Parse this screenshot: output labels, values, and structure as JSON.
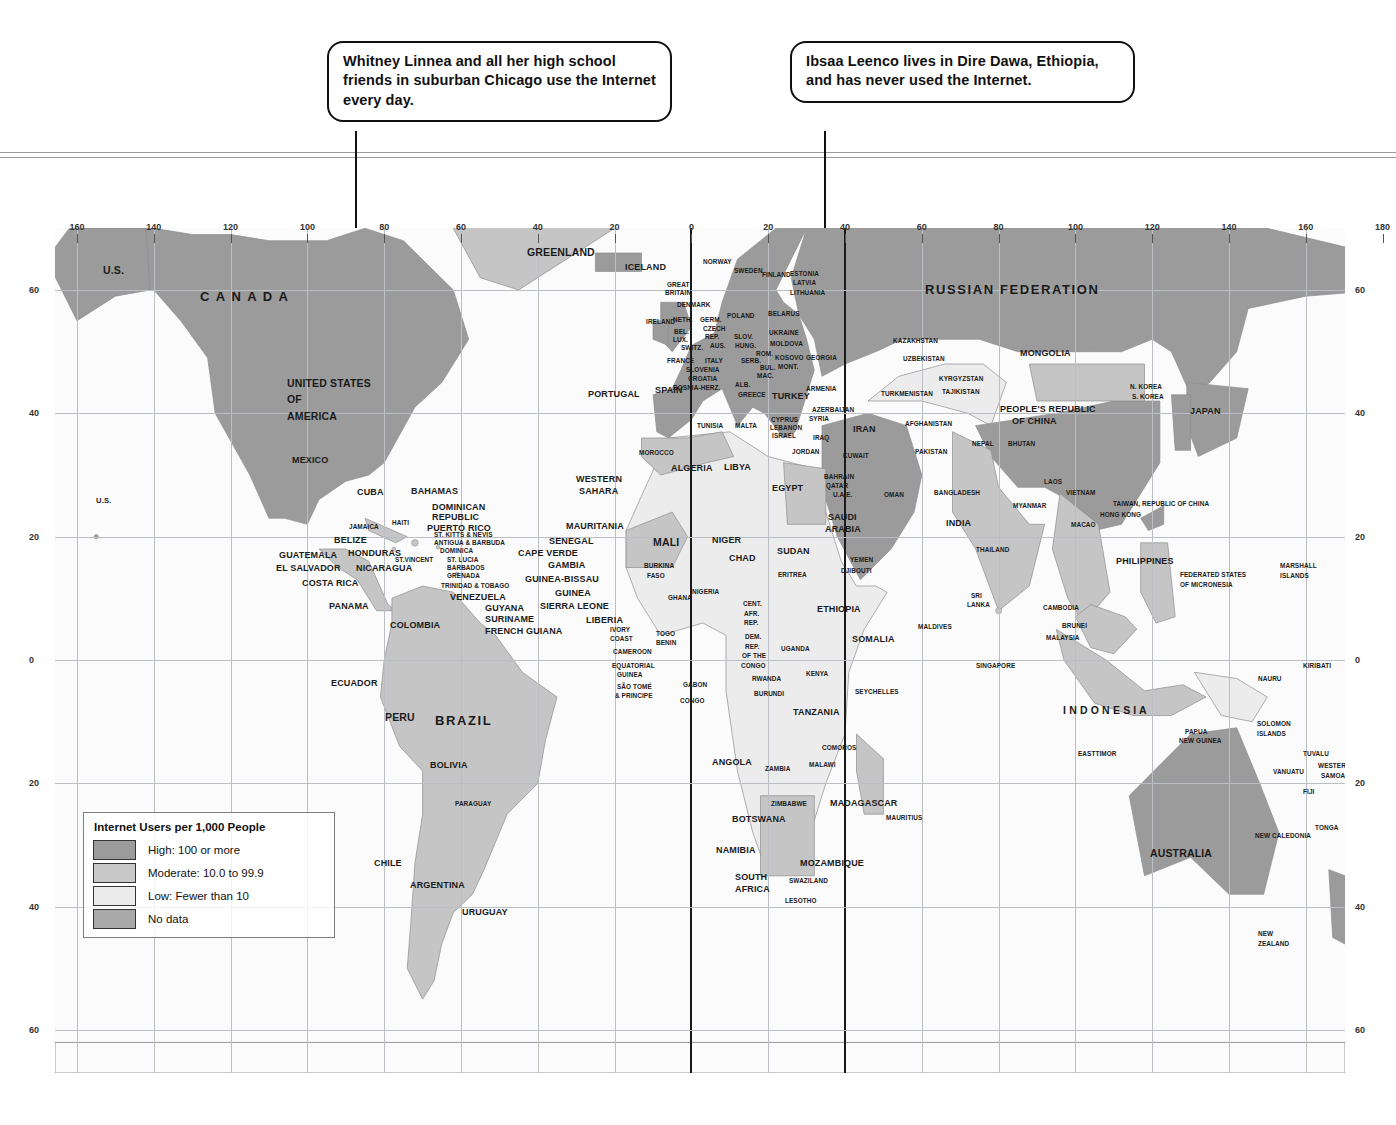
{
  "callouts": [
    {
      "id": "chicago",
      "text": "Whitney Linnea and all her high school friends in suburban Chicago use the Internet every day."
    },
    {
      "id": "ethiopia",
      "text": "Ibsaa Leenco lives in Dire Dawa, Ethiopia, and has never used the Internet."
    }
  ],
  "legend": {
    "title": "Internet Users per 1,000 People",
    "items": [
      {
        "label": "High: 100 or more",
        "color": "#9b9b9b"
      },
      {
        "label": "Moderate: 10.0 to 99.9",
        "color": "#c2c2c2"
      },
      {
        "label": "Low: Fewer than 10",
        "color": "#e8e8e8"
      },
      {
        "label": "No data",
        "color": "#a8a8a8"
      }
    ]
  },
  "axes": {
    "longitude_labels": [
      "160",
      "140",
      "120",
      "100",
      "80",
      "60",
      "40",
      "20",
      "0",
      "20",
      "40",
      "60",
      "80",
      "100",
      "120",
      "140",
      "160",
      "180"
    ],
    "latitude_labels_left": [
      "60",
      "40",
      "20",
      "0",
      "20",
      "40",
      "60"
    ],
    "latitude_labels_right": [
      "60",
      "40",
      "20",
      "0",
      "20",
      "40",
      "60"
    ]
  },
  "map_labels": [
    {
      "t": "U.S.",
      "x": 103,
      "y": 265,
      "s": "m"
    },
    {
      "t": "U.S.",
      "x": 96,
      "y": 497,
      "s": "s"
    },
    {
      "t": "C A N A D A",
      "x": 200,
      "y": 290,
      "s": "l"
    },
    {
      "t": "GREENLAND",
      "x": 527,
      "y": 247,
      "s": "m"
    },
    {
      "t": "UNITED STATES",
      "x": 287,
      "y": 378,
      "s": "m"
    },
    {
      "t": "OF",
      "x": 287,
      "y": 394,
      "s": "m"
    },
    {
      "t": "AMERICA",
      "x": 287,
      "y": 411,
      "s": "m"
    },
    {
      "t": "ICELAND",
      "x": 625,
      "y": 262,
      "s": ""
    },
    {
      "t": "MEXICO",
      "x": 292,
      "y": 455,
      "s": ""
    },
    {
      "t": "CUBA",
      "x": 357,
      "y": 487,
      "s": ""
    },
    {
      "t": "BAHAMAS",
      "x": 411,
      "y": 486,
      "s": ""
    },
    {
      "t": "DOMINICAN",
      "x": 432,
      "y": 502,
      "s": ""
    },
    {
      "t": "REPUBLIC",
      "x": 432,
      "y": 512,
      "s": ""
    },
    {
      "t": "PUERTO RICO",
      "x": 427,
      "y": 523,
      "s": ""
    },
    {
      "t": "HAITI",
      "x": 392,
      "y": 519,
      "s": "xs"
    },
    {
      "t": "JAMAICA",
      "x": 349,
      "y": 523,
      "s": "xs"
    },
    {
      "t": "ST. KITTS & NEVIS",
      "x": 434,
      "y": 531,
      "s": "xs"
    },
    {
      "t": "ANTIGUA & BARBUDA",
      "x": 434,
      "y": 539,
      "s": "xs"
    },
    {
      "t": "DOMINICA",
      "x": 440,
      "y": 547,
      "s": "xs"
    },
    {
      "t": "ST. LUCIA",
      "x": 447,
      "y": 556,
      "s": "xs"
    },
    {
      "t": "BARBADOS",
      "x": 447,
      "y": 564,
      "s": "xs"
    },
    {
      "t": "GRENADA",
      "x": 447,
      "y": 572,
      "s": "xs"
    },
    {
      "t": "ST.VINCENT",
      "x": 395,
      "y": 556,
      "s": "xs"
    },
    {
      "t": "TRINIDAD & TOBAGO",
      "x": 441,
      "y": 582,
      "s": "xs"
    },
    {
      "t": "BELIZE",
      "x": 334,
      "y": 535,
      "s": ""
    },
    {
      "t": "HONDURAS",
      "x": 348,
      "y": 548,
      "s": ""
    },
    {
      "t": "GUATEMALA",
      "x": 279,
      "y": 550,
      "s": ""
    },
    {
      "t": "EL SALVADOR",
      "x": 276,
      "y": 563,
      "s": ""
    },
    {
      "t": "NICARAGUA",
      "x": 356,
      "y": 563,
      "s": ""
    },
    {
      "t": "COSTA RICA",
      "x": 302,
      "y": 578,
      "s": ""
    },
    {
      "t": "PANAMA",
      "x": 329,
      "y": 601,
      "s": ""
    },
    {
      "t": "VENEZUELA",
      "x": 450,
      "y": 592,
      "s": ""
    },
    {
      "t": "GUYANA",
      "x": 485,
      "y": 603,
      "s": ""
    },
    {
      "t": "SURINAME",
      "x": 485,
      "y": 614,
      "s": ""
    },
    {
      "t": "FRENCH GUIANA",
      "x": 485,
      "y": 626,
      "s": ""
    },
    {
      "t": "COLOMBIA",
      "x": 390,
      "y": 620,
      "s": ""
    },
    {
      "t": "ECUADOR",
      "x": 331,
      "y": 678,
      "s": ""
    },
    {
      "t": "PERU",
      "x": 385,
      "y": 712,
      "s": "m"
    },
    {
      "t": "BRAZIL",
      "x": 435,
      "y": 714,
      "s": "l"
    },
    {
      "t": "BOLIVIA",
      "x": 430,
      "y": 760,
      "s": ""
    },
    {
      "t": "PARAGUAY",
      "x": 455,
      "y": 800,
      "s": "xs"
    },
    {
      "t": "CHILE",
      "x": 374,
      "y": 858,
      "s": ""
    },
    {
      "t": "ARGENTINA",
      "x": 410,
      "y": 880,
      "s": ""
    },
    {
      "t": "URUGUAY",
      "x": 462,
      "y": 907,
      "s": ""
    },
    {
      "t": "NORWAY",
      "x": 703,
      "y": 258,
      "s": "xs"
    },
    {
      "t": "SWEDEN",
      "x": 734,
      "y": 267,
      "s": "xs"
    },
    {
      "t": "FINLAND",
      "x": 762,
      "y": 271,
      "s": "xs"
    },
    {
      "t": "ESTONIA",
      "x": 790,
      "y": 270,
      "s": "xs"
    },
    {
      "t": "LATVIA",
      "x": 793,
      "y": 279,
      "s": "xs"
    },
    {
      "t": "LITHUANIA",
      "x": 790,
      "y": 289,
      "s": "xs"
    },
    {
      "t": "GREAT",
      "x": 667,
      "y": 281,
      "s": "xs"
    },
    {
      "t": "BRITAIN",
      "x": 665,
      "y": 289,
      "s": "xs"
    },
    {
      "t": "DENMARK",
      "x": 677,
      "y": 301,
      "s": "xs"
    },
    {
      "t": "IRELAND",
      "x": 646,
      "y": 318,
      "s": "xs"
    },
    {
      "t": "POLAND",
      "x": 727,
      "y": 312,
      "s": "xs"
    },
    {
      "t": "BELARUS",
      "x": 768,
      "y": 310,
      "s": "xs"
    },
    {
      "t": "NETH.",
      "x": 673,
      "y": 316,
      "s": "xs"
    },
    {
      "t": "GERM.",
      "x": 700,
      "y": 316,
      "s": "xs"
    },
    {
      "t": "BEL.",
      "x": 674,
      "y": 328,
      "s": "xs"
    },
    {
      "t": "LUX.",
      "x": 673,
      "y": 336,
      "s": "xs"
    },
    {
      "t": "CZECH",
      "x": 703,
      "y": 325,
      "s": "xs"
    },
    {
      "t": "REP.",
      "x": 705,
      "y": 333,
      "s": "xs"
    },
    {
      "t": "SLOV.",
      "x": 734,
      "y": 333,
      "s": "xs"
    },
    {
      "t": "UKRAINE",
      "x": 769,
      "y": 329,
      "s": "xs"
    },
    {
      "t": "MOLDOVA",
      "x": 770,
      "y": 340,
      "s": "xs"
    },
    {
      "t": "SWITZ.",
      "x": 681,
      "y": 344,
      "s": "xs"
    },
    {
      "t": "AUS.",
      "x": 710,
      "y": 342,
      "s": "xs"
    },
    {
      "t": "HUNG.",
      "x": 735,
      "y": 342,
      "s": "xs"
    },
    {
      "t": "ROM.",
      "x": 756,
      "y": 350,
      "s": "xs"
    },
    {
      "t": "FRANCE",
      "x": 667,
      "y": 357,
      "s": "xs"
    },
    {
      "t": "ITALY",
      "x": 705,
      "y": 357,
      "s": "xs"
    },
    {
      "t": "SERB.",
      "x": 741,
      "y": 357,
      "s": "xs"
    },
    {
      "t": "KOSOVO",
      "x": 775,
      "y": 354,
      "s": "xs"
    },
    {
      "t": "GEORGIA",
      "x": 806,
      "y": 354,
      "s": "xs"
    },
    {
      "t": "MONT.",
      "x": 778,
      "y": 363,
      "s": "xs"
    },
    {
      "t": "BUL.",
      "x": 760,
      "y": 364,
      "s": "xs"
    },
    {
      "t": "SLOVENIA",
      "x": 686,
      "y": 366,
      "s": "xs"
    },
    {
      "t": "CROATIA",
      "x": 688,
      "y": 375,
      "s": "xs"
    },
    {
      "t": "MAC.",
      "x": 757,
      "y": 372,
      "s": "xs"
    },
    {
      "t": "BOSNIA-HERZ.",
      "x": 673,
      "y": 384,
      "s": "xs"
    },
    {
      "t": "ALB.",
      "x": 735,
      "y": 381,
      "s": "xs"
    },
    {
      "t": "SPAIN",
      "x": 655,
      "y": 385,
      "s": ""
    },
    {
      "t": "PORTUGAL",
      "x": 588,
      "y": 389,
      "s": ""
    },
    {
      "t": "GREECE",
      "x": 738,
      "y": 391,
      "s": "xs"
    },
    {
      "t": "TURKEY",
      "x": 772,
      "y": 391,
      "s": ""
    },
    {
      "t": "ARMENIA",
      "x": 806,
      "y": 385,
      "s": "xs"
    },
    {
      "t": "AZERBAIJAN",
      "x": 812,
      "y": 406,
      "s": "xs"
    },
    {
      "t": "TURKMENISTAN",
      "x": 881,
      "y": 390,
      "s": "xs"
    },
    {
      "t": "KAZAKHSTAN",
      "x": 893,
      "y": 337,
      "s": "xs"
    },
    {
      "t": "UZBEKISTAN",
      "x": 903,
      "y": 355,
      "s": "xs"
    },
    {
      "t": "KYRGYZSTAN",
      "x": 939,
      "y": 375,
      "s": "xs"
    },
    {
      "t": "TAJIKISTAN",
      "x": 942,
      "y": 388,
      "s": "xs"
    },
    {
      "t": "RUSSIAN  FEDERATION",
      "x": 925,
      "y": 283,
      "s": "l"
    },
    {
      "t": "MONGOLIA",
      "x": 1020,
      "y": 348,
      "s": ""
    },
    {
      "t": "PEOPLE'S REPUBLIC",
      "x": 1000,
      "y": 404,
      "s": ""
    },
    {
      "t": "OF CHINA",
      "x": 1012,
      "y": 416,
      "s": ""
    },
    {
      "t": "N. KOREA",
      "x": 1130,
      "y": 383,
      "s": "xs"
    },
    {
      "t": "S. KOREA",
      "x": 1132,
      "y": 393,
      "s": "xs"
    },
    {
      "t": "JAPAN",
      "x": 1190,
      "y": 406,
      "s": ""
    },
    {
      "t": "NEPAL",
      "x": 972,
      "y": 440,
      "s": "xs"
    },
    {
      "t": "BHUTAN",
      "x": 1008,
      "y": 440,
      "s": "xs"
    },
    {
      "t": "AFGHANISTAN",
      "x": 905,
      "y": 420,
      "s": "xs"
    },
    {
      "t": "PAKISTAN",
      "x": 915,
      "y": 448,
      "s": "xs"
    },
    {
      "t": "BANGLADESH",
      "x": 934,
      "y": 489,
      "s": "xs"
    },
    {
      "t": "INDIA",
      "x": 946,
      "y": 518,
      "s": ""
    },
    {
      "t": "MYANMAR",
      "x": 1013,
      "y": 502,
      "s": "xs"
    },
    {
      "t": "LAOS",
      "x": 1044,
      "y": 478,
      "s": "xs"
    },
    {
      "t": "VIETNAM",
      "x": 1066,
      "y": 489,
      "s": "xs"
    },
    {
      "t": "HONG KONG",
      "x": 1100,
      "y": 511,
      "s": "xs"
    },
    {
      "t": "MACAO",
      "x": 1071,
      "y": 521,
      "s": "xs"
    },
    {
      "t": "TAIWAN, REPUBLIC OF CHINA",
      "x": 1113,
      "y": 500,
      "s": "xs"
    },
    {
      "t": "THAILAND",
      "x": 976,
      "y": 546,
      "s": "xs"
    },
    {
      "t": "SRI",
      "x": 971,
      "y": 592,
      "s": "xs"
    },
    {
      "t": "LANKA",
      "x": 967,
      "y": 601,
      "s": "xs"
    },
    {
      "t": "MALDIVES",
      "x": 918,
      "y": 623,
      "s": "xs"
    },
    {
      "t": "CAMBODIA",
      "x": 1043,
      "y": 604,
      "s": "xs"
    },
    {
      "t": "BRUNEI",
      "x": 1062,
      "y": 622,
      "s": "xs"
    },
    {
      "t": "MALAYSIA",
      "x": 1046,
      "y": 634,
      "s": "xs"
    },
    {
      "t": "SINGAPORE",
      "x": 976,
      "y": 662,
      "s": "xs"
    },
    {
      "t": "PHILIPPINES",
      "x": 1116,
      "y": 556,
      "s": ""
    },
    {
      "t": "FEDERATED STATES",
      "x": 1180,
      "y": 571,
      "s": "xs"
    },
    {
      "t": "OF MICRONESIA",
      "x": 1180,
      "y": 581,
      "s": "xs"
    },
    {
      "t": "MARSHALL",
      "x": 1280,
      "y": 562,
      "s": "xs"
    },
    {
      "t": "ISLANDS",
      "x": 1280,
      "y": 572,
      "s": "xs"
    },
    {
      "t": "I N D O N E S I A",
      "x": 1063,
      "y": 705,
      "s": "m"
    },
    {
      "t": "PAPUA",
      "x": 1185,
      "y": 728,
      "s": "xs"
    },
    {
      "t": "NEW GUINEA",
      "x": 1179,
      "y": 737,
      "s": "xs"
    },
    {
      "t": "EASTTIMOR",
      "x": 1078,
      "y": 750,
      "s": "xs"
    },
    {
      "t": "SOLOMON",
      "x": 1257,
      "y": 720,
      "s": "xs"
    },
    {
      "t": "ISLANDS",
      "x": 1257,
      "y": 730,
      "s": "xs"
    },
    {
      "t": "NAURU",
      "x": 1258,
      "y": 675,
      "s": "xs"
    },
    {
      "t": "KIRIBATI",
      "x": 1303,
      "y": 662,
      "s": "xs"
    },
    {
      "t": "TUVALU",
      "x": 1303,
      "y": 750,
      "s": "xs"
    },
    {
      "t": "VANUATU",
      "x": 1273,
      "y": 768,
      "s": "xs"
    },
    {
      "t": "WESTERN",
      "x": 1318,
      "y": 762,
      "s": "xs"
    },
    {
      "t": "SAMOA",
      "x": 1321,
      "y": 772,
      "s": "xs"
    },
    {
      "t": "FIJI",
      "x": 1303,
      "y": 788,
      "s": "xs"
    },
    {
      "t": "NEW CALEDONIA",
      "x": 1255,
      "y": 832,
      "s": "xs"
    },
    {
      "t": "TONGA",
      "x": 1315,
      "y": 824,
      "s": "xs"
    },
    {
      "t": "AUSTRALIA",
      "x": 1150,
      "y": 848,
      "s": "m"
    },
    {
      "t": "NEW",
      "x": 1258,
      "y": 930,
      "s": "xs"
    },
    {
      "t": "ZEALAND",
      "x": 1258,
      "y": 940,
      "s": "xs"
    },
    {
      "t": "MOROCCO",
      "x": 639,
      "y": 449,
      "s": "xs"
    },
    {
      "t": "TUNISIA",
      "x": 697,
      "y": 422,
      "s": "xs"
    },
    {
      "t": "MALTA",
      "x": 735,
      "y": 422,
      "s": "xs"
    },
    {
      "t": "ALGERIA",
      "x": 671,
      "y": 463,
      "s": ""
    },
    {
      "t": "LIBYA",
      "x": 724,
      "y": 462,
      "s": ""
    },
    {
      "t": "EGYPT",
      "x": 772,
      "y": 483,
      "s": ""
    },
    {
      "t": "CYPRUS",
      "x": 771,
      "y": 416,
      "s": "xs"
    },
    {
      "t": "LEBANON",
      "x": 770,
      "y": 424,
      "s": "xs"
    },
    {
      "t": "ISRAEL",
      "x": 772,
      "y": 432,
      "s": "xs"
    },
    {
      "t": "SYRIA",
      "x": 809,
      "y": 415,
      "s": "xs"
    },
    {
      "t": "IRAQ",
      "x": 813,
      "y": 434,
      "s": "xs"
    },
    {
      "t": "JORDAN",
      "x": 792,
      "y": 448,
      "s": "xs"
    },
    {
      "t": "IRAN",
      "x": 853,
      "y": 424,
      "s": ""
    },
    {
      "t": "KUWAIT",
      "x": 843,
      "y": 452,
      "s": "xs"
    },
    {
      "t": "BAHRAIN",
      "x": 824,
      "y": 473,
      "s": "xs"
    },
    {
      "t": "QATAR",
      "x": 826,
      "y": 482,
      "s": "xs"
    },
    {
      "t": "U.A.E.",
      "x": 833,
      "y": 491,
      "s": "xs"
    },
    {
      "t": "OMAN",
      "x": 884,
      "y": 491,
      "s": "xs"
    },
    {
      "t": "SAUDI",
      "x": 828,
      "y": 512,
      "s": ""
    },
    {
      "t": "ARABIA",
      "x": 825,
      "y": 524,
      "s": ""
    },
    {
      "t": "YEMEN",
      "x": 850,
      "y": 556,
      "s": "xs"
    },
    {
      "t": "DJIBOUTI",
      "x": 841,
      "y": 567,
      "s": "xs"
    },
    {
      "t": "WESTERN",
      "x": 576,
      "y": 474,
      "s": ""
    },
    {
      "t": "SAHARA",
      "x": 579,
      "y": 486,
      "s": ""
    },
    {
      "t": "MAURITANIA",
      "x": 566,
      "y": 521,
      "s": ""
    },
    {
      "t": "SENEGAL",
      "x": 549,
      "y": 536,
      "s": ""
    },
    {
      "t": "CAPE VERDE",
      "x": 518,
      "y": 548,
      "s": ""
    },
    {
      "t": "GAMBIA",
      "x": 548,
      "y": 560,
      "s": ""
    },
    {
      "t": "GUINEA-BISSAU",
      "x": 525,
      "y": 574,
      "s": ""
    },
    {
      "t": "GUINEA",
      "x": 555,
      "y": 588,
      "s": ""
    },
    {
      "t": "SIERRA LEONE",
      "x": 540,
      "y": 601,
      "s": ""
    },
    {
      "t": "LIBERIA",
      "x": 586,
      "y": 615,
      "s": ""
    },
    {
      "t": "IVORY",
      "x": 610,
      "y": 626,
      "s": "xs"
    },
    {
      "t": "COAST",
      "x": 610,
      "y": 635,
      "s": "xs"
    },
    {
      "t": "MALI",
      "x": 653,
      "y": 537,
      "s": "m"
    },
    {
      "t": "NIGER",
      "x": 712,
      "y": 535,
      "s": ""
    },
    {
      "t": "CHAD",
      "x": 729,
      "y": 553,
      "s": ""
    },
    {
      "t": "BURKINA",
      "x": 644,
      "y": 562,
      "s": "xs"
    },
    {
      "t": "FASO",
      "x": 647,
      "y": 572,
      "s": "xs"
    },
    {
      "t": "GHANA",
      "x": 668,
      "y": 594,
      "s": "xs"
    },
    {
      "t": "NIGERIA",
      "x": 692,
      "y": 588,
      "s": "xs"
    },
    {
      "t": "TOGO",
      "x": 656,
      "y": 630,
      "s": "xs"
    },
    {
      "t": "BENIN",
      "x": 656,
      "y": 639,
      "s": "xs"
    },
    {
      "t": "CAMEROON",
      "x": 613,
      "y": 648,
      "s": "xs"
    },
    {
      "t": "EQUATORIAL",
      "x": 612,
      "y": 662,
      "s": "xs"
    },
    {
      "t": "GUINEA",
      "x": 617,
      "y": 671,
      "s": "xs"
    },
    {
      "t": "SÃO TOMÉ",
      "x": 617,
      "y": 683,
      "s": "xs"
    },
    {
      "t": "& PRINCIPE",
      "x": 615,
      "y": 692,
      "s": "xs"
    },
    {
      "t": "GABON",
      "x": 683,
      "y": 681,
      "s": "xs"
    },
    {
      "t": "CONGO",
      "x": 680,
      "y": 697,
      "s": "xs"
    },
    {
      "t": "SUDAN",
      "x": 777,
      "y": 546,
      "s": ""
    },
    {
      "t": "ERITREA",
      "x": 778,
      "y": 571,
      "s": "xs"
    },
    {
      "t": "ETHIOPIA",
      "x": 817,
      "y": 604,
      "s": ""
    },
    {
      "t": "SOMALIA",
      "x": 852,
      "y": 634,
      "s": ""
    },
    {
      "t": "CENT.",
      "x": 743,
      "y": 600,
      "s": "xs"
    },
    {
      "t": "AFR.",
      "x": 744,
      "y": 610,
      "s": "xs"
    },
    {
      "t": "REP.",
      "x": 744,
      "y": 619,
      "s": "xs"
    },
    {
      "t": "DEM.",
      "x": 745,
      "y": 633,
      "s": "xs"
    },
    {
      "t": "REP.",
      "x": 745,
      "y": 643,
      "s": "xs"
    },
    {
      "t": "OF THE",
      "x": 742,
      "y": 652,
      "s": "xs"
    },
    {
      "t": "CONGO",
      "x": 741,
      "y": 662,
      "s": "xs"
    },
    {
      "t": "UGANDA",
      "x": 781,
      "y": 645,
      "s": "xs"
    },
    {
      "t": "KENYA",
      "x": 806,
      "y": 670,
      "s": "xs"
    },
    {
      "t": "RWANDA",
      "x": 752,
      "y": 675,
      "s": "xs"
    },
    {
      "t": "BURUNDI",
      "x": 754,
      "y": 690,
      "s": "xs"
    },
    {
      "t": "TANZANIA",
      "x": 793,
      "y": 707,
      "s": ""
    },
    {
      "t": "SEYCHELLES",
      "x": 855,
      "y": 688,
      "s": "xs"
    },
    {
      "t": "ANGOLA",
      "x": 712,
      "y": 757,
      "s": ""
    },
    {
      "t": "ZAMBIA",
      "x": 765,
      "y": 765,
      "s": "xs"
    },
    {
      "t": "MALAWI",
      "x": 809,
      "y": 761,
      "s": "xs"
    },
    {
      "t": "COMOROS",
      "x": 822,
      "y": 744,
      "s": "xs"
    },
    {
      "t": "MADAGASCAR",
      "x": 830,
      "y": 798,
      "s": ""
    },
    {
      "t": "MAURITIUS",
      "x": 886,
      "y": 814,
      "s": "xs"
    },
    {
      "t": "ZIMBABWE",
      "x": 771,
      "y": 800,
      "s": "xs"
    },
    {
      "t": "BOTSWANA",
      "x": 732,
      "y": 814,
      "s": ""
    },
    {
      "t": "NAMIBIA",
      "x": 716,
      "y": 845,
      "s": ""
    },
    {
      "t": "MOZAMBIQUE",
      "x": 800,
      "y": 858,
      "s": ""
    },
    {
      "t": "SWAZILAND",
      "x": 789,
      "y": 877,
      "s": "xs"
    },
    {
      "t": "SOUTH",
      "x": 735,
      "y": 872,
      "s": ""
    },
    {
      "t": "AFRICA",
      "x": 735,
      "y": 884,
      "s": ""
    },
    {
      "t": "LESOTHO",
      "x": 785,
      "y": 897,
      "s": "xs"
    },
    {
      "t": "A N T A R C T I C A",
      "x": 700,
      "y": 1085,
      "s": "xl"
    }
  ]
}
